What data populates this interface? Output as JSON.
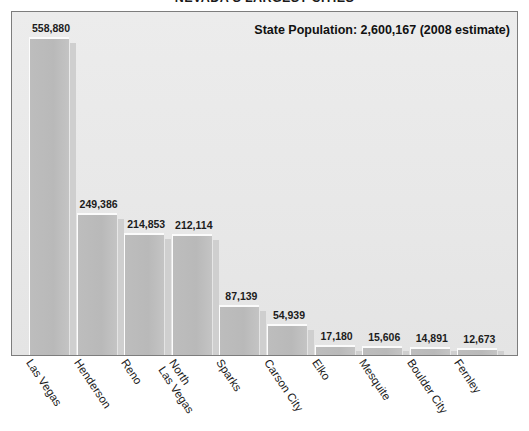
{
  "chart_data": {
    "type": "bar",
    "title": "NEVADA'S LARGEST CITIES",
    "xlabel": "",
    "ylabel": "",
    "ylim": [
      0,
      600000
    ],
    "grid": false,
    "legend": "none",
    "categories": [
      "Las Vegas",
      "Henderson",
      "Reno",
      "North Las Vegas",
      "Sparks",
      "Carson City",
      "Elko",
      "Mesquite",
      "Boulder City",
      "Fernley"
    ],
    "category_lines": [
      [
        "Las Vegas"
      ],
      [
        "Henderson"
      ],
      [
        "Reno"
      ],
      [
        "North",
        "Las Vegas"
      ],
      [
        "Sparks"
      ],
      [
        "Carson City"
      ],
      [
        "Elko"
      ],
      [
        "Mesquite"
      ],
      [
        "Boulder City"
      ],
      [
        "Fernley"
      ]
    ],
    "values": [
      558880,
      249386,
      214853,
      212114,
      87139,
      54939,
      17180,
      15606,
      14891,
      12673
    ],
    "value_labels": [
      "558,880",
      "249,386",
      "214,853",
      "212,114",
      "87,139",
      "54,939",
      "17,180",
      "15,606",
      "14,891",
      "12,673"
    ],
    "annotation": "State Population: 2,600,167 (2008 estimate)",
    "bar_color": "#bdbdbd",
    "bar_shadow_color": "#cfcfcf",
    "plot_background": "#e9e9e9",
    "frame_color": "#7d7d7d",
    "axis_color": "#5d5d5d",
    "label_color": "#1b1b1b"
  },
  "annotation": {
    "state_population": "State Population: 2,600,167 (2008 estimate)"
  },
  "title": {
    "text": "NEVADA'S LARGEST CITIES"
  }
}
